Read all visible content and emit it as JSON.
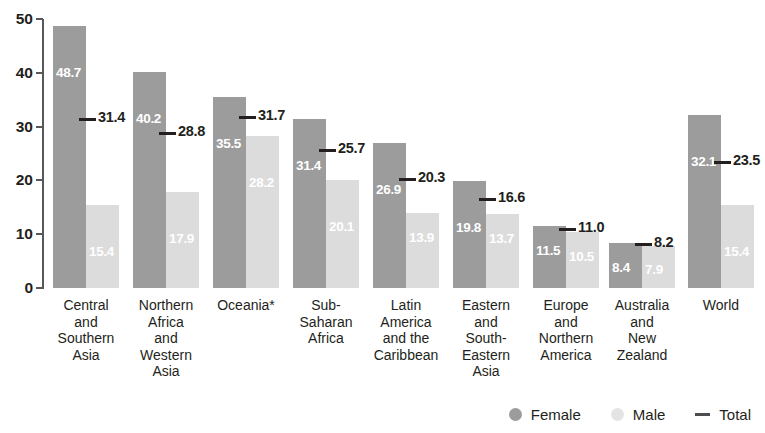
{
  "chart_data": {
    "type": "bar",
    "title": "",
    "xlabel": "",
    "ylabel": "",
    "ylim": [
      0,
      50
    ],
    "yticks": [
      0,
      10,
      20,
      30,
      40,
      50
    ],
    "grid": false,
    "legend_position": "bottom-right",
    "categories": [
      "Central\nand\nSouthern\nAsia",
      "Northern\nAfrica\nand\nWestern\nAsia",
      "Oceania*",
      "Sub-\nSaharan\nAfrica",
      "Latin\nAmerica\nand the\nCaribbean",
      "Eastern\nand\nSouth-\nEastern\nAsia",
      "Europe\nand\nNorthern\nAmerica",
      "Australia\nand\nNew\nZealand",
      "World"
    ],
    "series": [
      {
        "name": "Female",
        "color": "#9c9c9c",
        "values": [
          48.7,
          40.2,
          35.5,
          31.4,
          26.9,
          19.8,
          11.5,
          8.4,
          32.1
        ],
        "labels": [
          "48.7",
          "40.2",
          "35.5",
          "31.4",
          "26.9",
          "19.8",
          "11.5",
          "8.4",
          "32.1"
        ]
      },
      {
        "name": "Male",
        "color": "#dcdcdc",
        "values": [
          15.4,
          17.9,
          28.2,
          20.1,
          13.9,
          13.7,
          10.5,
          7.9,
          15.4
        ],
        "labels": [
          "15.4",
          "17.9",
          "28.2",
          "20.1",
          "13.9",
          "13.7",
          "10.5",
          "7.9",
          "15.4"
        ]
      },
      {
        "name": "Total",
        "color": "#231f20",
        "marker": "dash",
        "values": [
          31.4,
          28.8,
          31.7,
          25.7,
          20.3,
          16.6,
          11.0,
          8.2,
          23.5
        ],
        "labels": [
          "31.4",
          "28.8",
          "31.7",
          "25.7",
          "20.3",
          "16.6",
          "11.0",
          "8.2",
          "23.5"
        ]
      }
    ]
  },
  "axis": {
    "y_tick_labels": [
      "50",
      "40",
      "30",
      "20",
      "10",
      "0"
    ]
  },
  "legend": {
    "items": [
      {
        "label": "Female",
        "marker": "circle",
        "color": "#9c9c9c"
      },
      {
        "label": "Male",
        "marker": "circle",
        "color": "#e4e4e4"
      },
      {
        "label": "Total",
        "marker": "dash",
        "color": "#4d4d4f"
      }
    ]
  }
}
